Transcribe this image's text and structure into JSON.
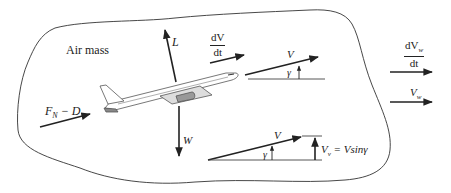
{
  "figure": {
    "type": "diagram",
    "colors": {
      "line": "#222222",
      "boundary": "#333333",
      "aircraft": "#555555",
      "background": "#ffffff"
    }
  },
  "labels": {
    "air_mass": "Air mass",
    "lift": "L",
    "weight": "W",
    "thrust_minus_drag": {
      "main": "F",
      "sub": "N",
      "rest": " − D"
    },
    "acceleration": {
      "numerator": "dV",
      "denominator": "dt"
    },
    "velocity_upper": "V",
    "gamma_upper": "γ",
    "velocity_lower": "V",
    "gamma_lower": "γ",
    "vertical_velocity": {
      "main": "V",
      "sub": "v",
      "rest": " =  Vsinγ"
    },
    "wind_acceleration": {
      "numerator_main": "dV",
      "numerator_sub": "w",
      "denominator": "dt"
    },
    "wind_velocity": {
      "main": "V",
      "sub": "w"
    }
  },
  "vectors": [
    {
      "name": "lift",
      "direction": "up (slightly tilted)"
    },
    {
      "name": "weight",
      "direction": "down"
    },
    {
      "name": "thrust-minus-drag",
      "direction": "along flight path"
    },
    {
      "name": "acceleration",
      "direction": "along flight path"
    },
    {
      "name": "velocity",
      "direction": "flight path angle gamma above horizontal"
    },
    {
      "name": "vertical-velocity",
      "direction": "up"
    },
    {
      "name": "wind-acceleration",
      "direction": "right (horizontal)"
    },
    {
      "name": "wind-velocity",
      "direction": "right (horizontal)"
    }
  ]
}
